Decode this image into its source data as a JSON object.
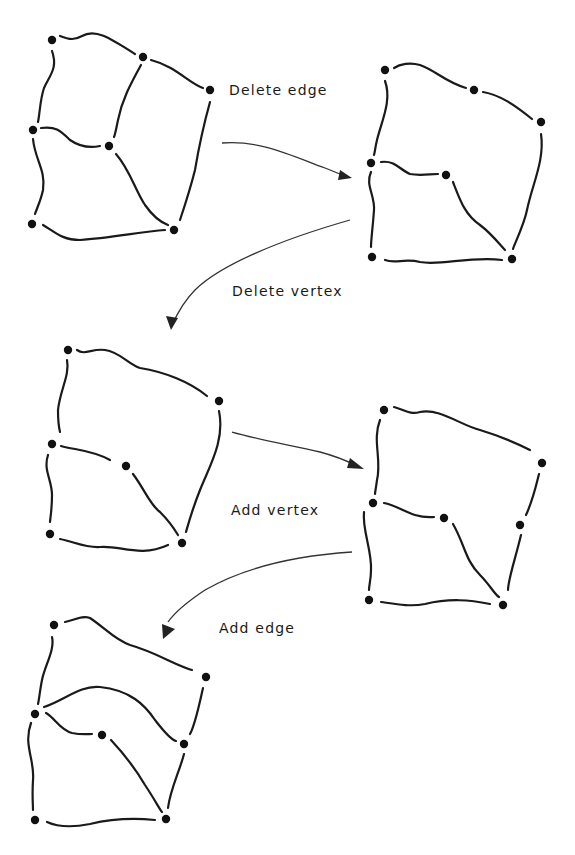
{
  "colors": {
    "ink": "#1a1a1a",
    "vertex": "#111111",
    "background": "#ffffff"
  },
  "operations": [
    {
      "id": "delete-edge",
      "label": "Delete edge",
      "from": 0,
      "to": 1
    },
    {
      "id": "delete-vertex",
      "label": "Delete vertex",
      "from": 1,
      "to": 2
    },
    {
      "id": "add-vertex",
      "label": "Add vertex",
      "from": 2,
      "to": 3
    },
    {
      "id": "add-edge",
      "label": "Add edge",
      "from": 3,
      "to": 4
    }
  ],
  "labels_pos": [
    {
      "x": 229,
      "y": 82
    },
    {
      "x": 232,
      "y": 283
    },
    {
      "x": 231,
      "y": 502
    },
    {
      "x": 219,
      "y": 620
    }
  ],
  "graphs": [
    {
      "name": "graph-1-original",
      "vertices": [
        [
          52,
          40
        ],
        [
          143,
          57
        ],
        [
          210,
          90
        ],
        [
          33,
          130
        ],
        [
          109,
          146
        ],
        [
          32,
          224
        ],
        [
          174,
          230
        ]
      ],
      "edges": [
        "M60,36 C70,40 75,40 82,36 C95,28 110,38 135,54",
        "M151,60 C175,66 190,84 203,88",
        "M52,51 C58,68 50,75 44,88 C40,100 40,112 38,122",
        "M210,102 C205,120 200,140 195,170 C190,190 185,205 180,220",
        "M141,65 C130,85 122,100 118,120 C116,130 115,135 114,137",
        "M41,128 C55,126 60,130 70,140 C80,147 90,148 100,146",
        "M33,139 C35,160 46,170 43,190 C41,200 37,208 35,214",
        "M116,154 C130,170 135,190 145,205 C152,215 160,222 168,225",
        "M43,225 C55,232 62,240 80,240 C110,238 140,232 165,230"
      ]
    },
    {
      "name": "graph-2-edge-deleted",
      "vertices": [
        [
          385,
          70
        ],
        [
          474,
          90
        ],
        [
          541,
          122
        ],
        [
          371,
          163
        ],
        [
          446,
          175
        ],
        [
          372,
          257
        ],
        [
          512,
          259
        ]
      ],
      "edges": [
        "M394,68 C400,64 410,62 420,65 C435,70 445,82 466,88",
        "M483,92 C500,95 515,105 532,119",
        "M385,81 C392,100 382,120 377,140 C375,148 375,152 374,155",
        "M541,134 C545,160 532,185 527,210 C524,225 514,245 513,249",
        "M381,162 C395,160 400,170 410,174 C420,176 430,174 438,174",
        "M371,172 C365,185 375,195 374,210 C373,225 371,240 371,247",
        "M453,182 C460,200 465,215 480,225 C492,234 500,245 505,250",
        "M385,260 C395,264 405,258 420,262 C440,266 470,256 502,260"
      ]
    },
    {
      "name": "graph-3-vertex-deleted",
      "vertices": [
        [
          68,
          350
        ],
        [
          219,
          401
        ],
        [
          52,
          444
        ],
        [
          126,
          466
        ],
        [
          182,
          543
        ],
        [
          50,
          534
        ]
      ],
      "edges": [
        "M77,350 C85,356 92,348 105,350 C120,352 128,364 140,368 C165,372 190,382 207,396",
        "M67,360 C70,375 60,390 58,410 C58,420 59,428 60,432",
        "M219,411 C225,440 210,465 200,490 C192,510 188,525 186,532",
        "M61,446 C75,450 92,450 110,460",
        "M48,455 C43,470 52,480 52,495 C52,510 50,520 50,522",
        "M133,474 C145,490 150,505 160,512 C170,522 175,530 178,535",
        "M60,539 C75,542 85,548 100,547 C120,545 140,558 168,545"
      ]
    },
    {
      "name": "graph-4-vertex-added",
      "vertices": [
        [
          384,
          410
        ],
        [
          542,
          463
        ],
        [
          373,
          503
        ],
        [
          444,
          518
        ],
        [
          520,
          525
        ],
        [
          369,
          600
        ],
        [
          503,
          605
        ]
      ],
      "edges": [
        "M394,407 C405,410 410,415 420,412 C440,408 460,425 480,430 C500,436 520,445 530,450",
        "M380,420 C372,440 382,460 377,480 C376,488 375,492 375,494",
        "M539,474 C535,490 533,500 526,515",
        "M521,535 C515,560 508,580 508,590",
        "M384,503 C395,505 405,512 415,515 C425,518 432,517 434,517",
        "M364,512 C362,530 372,550 371,570 C371,580 369,585 369,590",
        "M453,524 C465,545 465,560 480,575 C490,585 495,595 499,597",
        "M381,602 C395,604 410,607 425,604 C450,598 470,600 490,604"
      ]
    },
    {
      "name": "graph-5-edge-added",
      "vertices": [
        [
          54,
          625
        ],
        [
          206,
          677
        ],
        [
          35,
          714
        ],
        [
          102,
          735
        ],
        [
          184,
          744
        ],
        [
          35,
          820
        ],
        [
          166,
          819
        ]
      ],
      "edges": [
        "M65,622 C75,620 82,615 90,618 C105,628 115,640 130,645 C155,652 175,665 192,670",
        "M52,637 C55,650 45,665 42,680 C40,690 39,700 38,704",
        "M203,688 C198,710 195,725 190,734",
        "M184,754 C180,770 170,790 168,808",
        "M44,707 C65,700 80,685 100,687 C130,690 145,705 155,720 C165,733 172,740 176,741",
        "M46,713 C55,718 60,730 72,733 C82,735 88,734 92,734",
        "M31,723 C23,745 35,760 33,780 C32,795 33,805 33,810",
        "M111,740 C125,755 135,768 145,785 C155,800 160,810 162,812",
        "M47,822 C60,828 75,827 90,824 C115,818 135,818 155,820"
      ]
    }
  ],
  "arrows": [
    {
      "path": "M222,143 C260,140 290,155 325,168 C335,172 342,175 348,177",
      "head": [
        [
          352,
          178
        ],
        [
          340,
          170
        ],
        [
          338,
          180
        ]
      ]
    },
    {
      "path": "M350,220 C280,240 220,265 195,290 C185,300 178,312 172,325",
      "head": [
        [
          171,
          330
        ],
        [
          166,
          316
        ],
        [
          178,
          318
        ]
      ]
    },
    {
      "path": "M232,432 C260,440 290,445 320,452 C335,456 345,460 355,465",
      "head": [
        [
          364,
          469
        ],
        [
          350,
          458
        ],
        [
          347,
          468
        ]
      ]
    },
    {
      "path": "M352,552 C290,556 240,570 205,590 C190,600 175,612 168,622",
      "head": [
        [
          163,
          639
        ],
        [
          162,
          624
        ],
        [
          175,
          629
        ]
      ]
    }
  ]
}
